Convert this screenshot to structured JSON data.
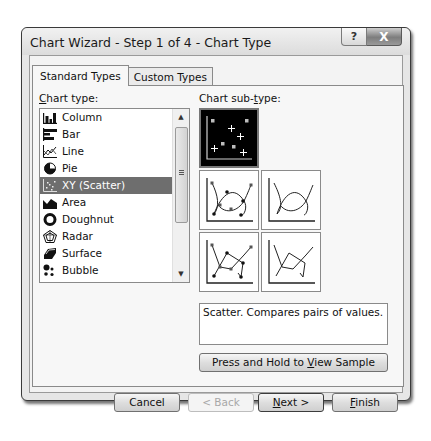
{
  "window": {
    "title": "Chart Wizard - Step 1 of 4 - Chart Type",
    "help_label": "?",
    "close_label": "X"
  },
  "tabs": [
    {
      "label": "Standard Types",
      "active": true
    },
    {
      "label": "Custom Types",
      "active": false
    }
  ],
  "chart_type": {
    "label_accel": "C",
    "label_rest": "hart type:",
    "items": [
      {
        "label": "Column",
        "icon": "column-chart-icon"
      },
      {
        "label": "Bar",
        "icon": "bar-chart-icon"
      },
      {
        "label": "Line",
        "icon": "line-chart-icon"
      },
      {
        "label": "Pie",
        "icon": "pie-chart-icon"
      },
      {
        "label": "XY (Scatter)",
        "icon": "scatter-chart-icon",
        "selected": true
      },
      {
        "label": "Area",
        "icon": "area-chart-icon"
      },
      {
        "label": "Doughnut",
        "icon": "doughnut-chart-icon"
      },
      {
        "label": "Radar",
        "icon": "radar-chart-icon"
      },
      {
        "label": "Surface",
        "icon": "surface-chart-icon"
      },
      {
        "label": "Bubble",
        "icon": "bubble-chart-icon"
      }
    ],
    "scroll_up": "▲",
    "scroll_down": "▼"
  },
  "sub_type": {
    "label_pre": "Chart sub-",
    "label_accel": "t",
    "label_post": "ype:",
    "options": [
      {
        "name": "scatter-markers-only",
        "selected": true
      },
      {
        "name": "scatter-smoothed-lines-markers",
        "selected": false
      },
      {
        "name": "scatter-smoothed-lines",
        "selected": false
      },
      {
        "name": "scatter-straight-lines-markers",
        "selected": false
      },
      {
        "name": "scatter-straight-lines",
        "selected": false
      }
    ]
  },
  "description": "Scatter. Compares pairs of values.",
  "view_sample": {
    "label_pre": "Press and Hold to ",
    "label_accel": "V",
    "label_post": "iew Sample"
  },
  "buttons": {
    "cancel": "Cancel",
    "back": "< Back",
    "next_accel": "N",
    "next_rest": "ext >",
    "finish_accel": "F",
    "finish_rest": "inish"
  }
}
